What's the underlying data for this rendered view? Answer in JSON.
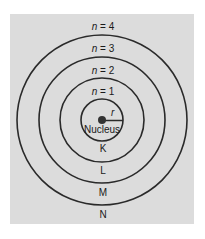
{
  "diagram": {
    "colors": {
      "background": "#dcdcdc",
      "line": "#2a2a2a",
      "nucleus": "#333333",
      "text": "#1a1a1a"
    },
    "center": {
      "x": 102,
      "y": 120
    },
    "nucleus": {
      "label": "Nucleus",
      "radius": 4
    },
    "radius_label": "r",
    "orbits": [
      {
        "n_label": "n = 1",
        "n_var": "n",
        "n_value": "= 1",
        "shell": "K",
        "radius": 21
      },
      {
        "n_label": "n = 2",
        "n_var": "n",
        "n_value": "= 2",
        "shell": "L",
        "radius": 42
      },
      {
        "n_label": "n = 3",
        "n_var": "n",
        "n_value": "= 3",
        "shell": "M",
        "radius": 63
      },
      {
        "n_label": "n = 4",
        "n_var": "n",
        "n_value": "= 4",
        "shell": "N",
        "radius": 85
      }
    ]
  }
}
